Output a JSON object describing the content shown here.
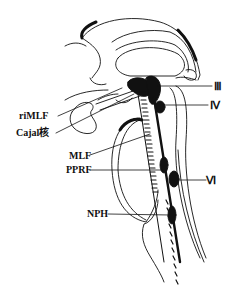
{
  "diagram": {
    "title": "",
    "colors": {
      "ink": "#111111",
      "background": "#ffffff"
    },
    "labels_left": [
      {
        "id": "riMLF",
        "text": "riMLF"
      },
      {
        "id": "cajal",
        "text": "Cajal核"
      },
      {
        "id": "MLF",
        "text": "MLF"
      },
      {
        "id": "PPRF",
        "text": "PPRF"
      },
      {
        "id": "NPH",
        "text": "NPH"
      }
    ],
    "labels_right": [
      {
        "id": "III",
        "text": "Ⅲ"
      },
      {
        "id": "IV",
        "text": "Ⅳ"
      },
      {
        "id": "VI",
        "text": "Ⅵ"
      }
    ]
  }
}
